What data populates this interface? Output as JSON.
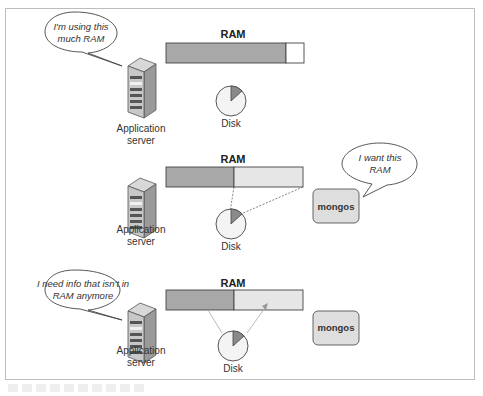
{
  "figure": {
    "panels": [
      {
        "id": "panel-1",
        "bubble": {
          "lines": [
            "I'm using this",
            "much RAM"
          ]
        },
        "server": {
          "lines": [
            "Application",
            "server"
          ]
        },
        "ram": {
          "title": "RAM",
          "used_fraction": 0.87,
          "used_color": "#a8a8a8",
          "free_color": "#ffffff"
        },
        "disk": {
          "label": "Disk"
        }
      },
      {
        "id": "panel-2",
        "bubble": {
          "lines": [
            "I want this",
            "RAM"
          ]
        },
        "server": {
          "lines": [
            "Application",
            "server"
          ]
        },
        "ram": {
          "title": "RAM",
          "used_fraction": 0.5,
          "used_color": "#a8a8a8",
          "free_color": "#e6e6e6"
        },
        "disk": {
          "label": "Disk"
        },
        "mongos": {
          "label": "mongos"
        }
      },
      {
        "id": "panel-3",
        "bubble": {
          "lines": [
            "I need info that isn't in",
            "RAM anymore"
          ]
        },
        "server": {
          "lines": [
            "Application",
            "server"
          ]
        },
        "ram": {
          "title": "RAM",
          "used_fraction": 0.5,
          "used_color": "#a8a8a8",
          "free_color": "#e6e6e6"
        },
        "disk": {
          "label": "Disk"
        },
        "mongos": {
          "label": "mongos"
        }
      }
    ]
  }
}
